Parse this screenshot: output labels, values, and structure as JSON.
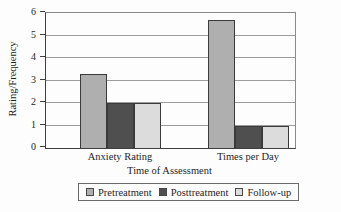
{
  "chart_data": {
    "type": "bar",
    "title": "",
    "xlabel": "Time of Assessment",
    "ylabel": "Rating/Frequency",
    "categories": [
      "Anxiety Rating",
      "Times per Day"
    ],
    "series": [
      {
        "name": "Pretreatment",
        "color": "#afafaf",
        "values": [
          3.3,
          5.7
        ]
      },
      {
        "name": "Posttreatment",
        "color": "#4f4f4f",
        "values": [
          2,
          1
        ]
      },
      {
        "name": "Follow-up",
        "color": "#dcdcdc",
        "values": [
          2,
          1
        ]
      }
    ],
    "ylim": [
      0,
      6
    ],
    "y_ticks": [
      0,
      1,
      2,
      3,
      4,
      5,
      6
    ],
    "grid": "horizontal",
    "legend_position": "bottom",
    "axis_color": "#3f3f3f",
    "gridline_color": "#9c9c9c"
  }
}
